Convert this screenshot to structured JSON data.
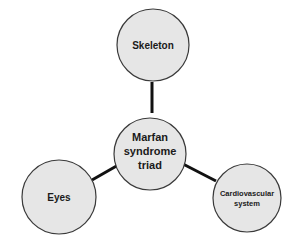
{
  "diagram": {
    "title": "Marfan syndrome triad",
    "colors": {
      "node_fill": "#e6e6e6",
      "node_stroke": "#3a3a3a",
      "edge": "#111111",
      "text": "#1a1a1a",
      "background": "#ffffff"
    },
    "center": {
      "id": "center",
      "lines": [
        "Marfan",
        "syndrome",
        "triad"
      ]
    },
    "nodes": [
      {
        "id": "skeleton",
        "lines": [
          "Skeleton"
        ]
      },
      {
        "id": "eyes",
        "lines": [
          "Eyes"
        ]
      },
      {
        "id": "cardiovascular",
        "lines": [
          "Cardiovascular",
          "system"
        ]
      }
    ],
    "edges": [
      {
        "from": "center",
        "to": "skeleton"
      },
      {
        "from": "center",
        "to": "eyes"
      },
      {
        "from": "center",
        "to": "cardiovascular"
      }
    ]
  }
}
